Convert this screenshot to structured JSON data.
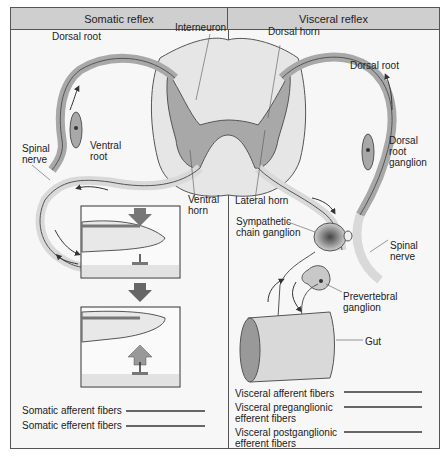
{
  "panels": {
    "left": {
      "title": "Somatic reflex"
    },
    "right": {
      "title": "Visceral reflex"
    }
  },
  "labels": {
    "interneuron": "Interneuron",
    "dorsal_root_left": "Dorsal root",
    "spinal_nerve_left": "Spinal\nnerve",
    "ventral_root": "Ventral\nroot",
    "ventral_horn": "Ventral\nhorn",
    "dorsal_horn": "Dorsal horn",
    "dorsal_root_right": "Dorsal root",
    "dorsal_root_ganglion": "Dorsal\nroot\nganglion",
    "lateral_horn": "Lateral horn",
    "sympathetic_chain_ganglion": "Sympathetic\nchain ganglion",
    "spinal_nerve_right": "Spinal\nnerve",
    "prevertebral_ganglion": "Prevertebral\nganglion",
    "gut": "Gut"
  },
  "legend": {
    "somatic": [
      {
        "label": "Somatic afferent fibers"
      },
      {
        "label": "Somatic efferent fibers"
      }
    ],
    "visceral": [
      {
        "label": "Visceral afferent fibers"
      },
      {
        "label": "Visceral preganglionic\nefferent fibers"
      },
      {
        "label": "Visceral postganglionic\nefferent fibers"
      }
    ]
  },
  "colors": {
    "frame": "#555555",
    "header_bg": "#cfcfcf",
    "white_matter": "#e6e6e6",
    "gray_matter": "#a8a8a8",
    "nerve": "#bdbdbd",
    "legend_line": "#666666"
  }
}
